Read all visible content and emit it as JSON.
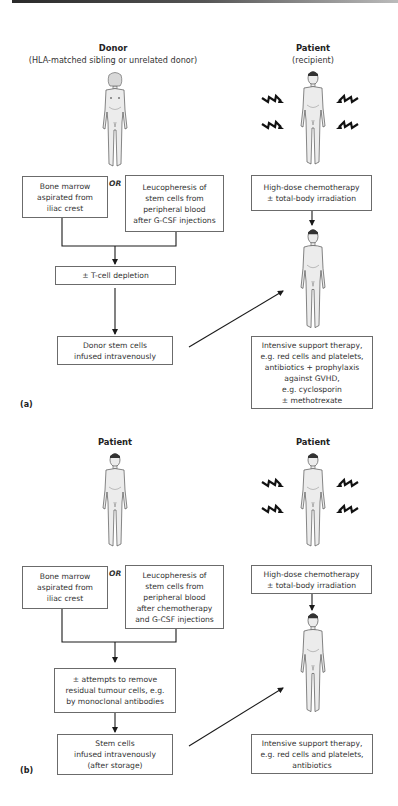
{
  "figure": {
    "panel_a": {
      "label": "(a)",
      "donor": {
        "title": "Donor",
        "subtitle": "(HLA-matched sibling or unrelated donor)"
      },
      "patient": {
        "title": "Patient",
        "subtitle": "(recipient)"
      },
      "source_box_1": "Bone marrow\naspirated from\niliac crest",
      "or_label": "OR",
      "source_box_2": "Leucopheresis of\nstem cells from\nperipheral blood\nafter G-CSF injections",
      "processing_box": "± T-cell depletion",
      "infusion_box": "Donor stem cells\ninfused intravenously",
      "conditioning_box": "High-dose chemotherapy\n± total-body irradiation",
      "support_box": "Intensive support therapy,\ne.g. red cells and platelets,\nantibiotics + prophylaxis\nagainst GVHD,\ne.g. cyclosporin\n± methotrexate"
    },
    "panel_b": {
      "label": "(b)",
      "left_patient": {
        "title": "Patient"
      },
      "right_patient": {
        "title": "Patient"
      },
      "source_box_1": "Bone marrow\naspirated from\niliac crest",
      "or_label": "OR",
      "source_box_2": "Leucopheresis of\nstem cells from\nperipheral blood\nafter chemotherapy\nand G-CSF injections",
      "processing_box": "± attempts to remove\nresidual tumour cells, e.g.\nby monoclonal antibodies",
      "infusion_box": "Stem cells\ninfused intravenously\n(after storage)",
      "conditioning_box": "High-dose chemotherapy\n± total-body irradiation",
      "support_box": "Intensive support therapy,\ne.g. red cells and platelets,\nantibiotics"
    },
    "colors": {
      "line": "#1a1a1a",
      "box_border": "#6b6b6b",
      "figure_fill": "#ececec",
      "figure_stroke": "#555555"
    }
  }
}
